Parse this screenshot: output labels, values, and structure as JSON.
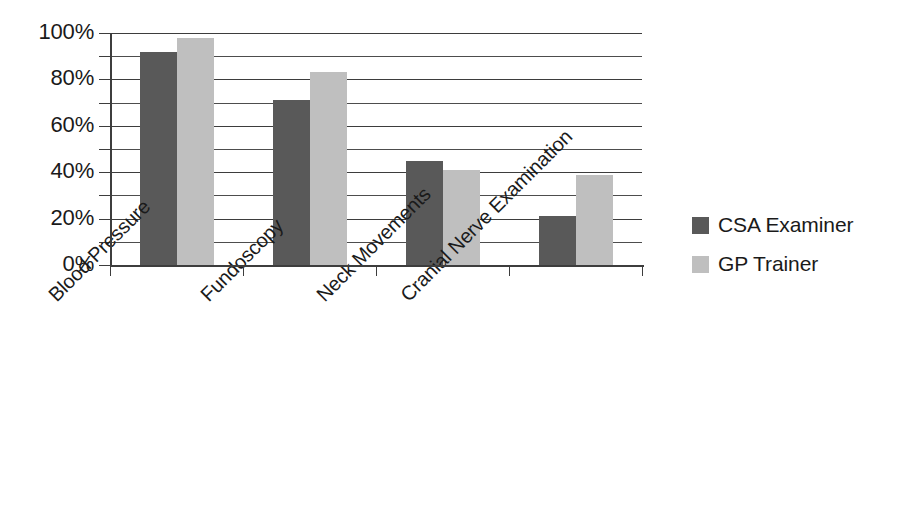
{
  "chart_data": {
    "type": "bar",
    "title": "",
    "subtitle": "",
    "xlabel": "",
    "ylabel": "",
    "categories": [
      "Blood Pressure",
      "Fundoscopy",
      "Neck Movements",
      "Cranial Nerve Examination"
    ],
    "series": [
      {
        "name": "CSA Examiner",
        "values": [
          92,
          71,
          45,
          21
        ],
        "color": "#595959"
      },
      {
        "name": "GP Trainer",
        "values": [
          98,
          83,
          41,
          39
        ],
        "color": "#bfbfbf"
      }
    ],
    "ylim": [
      0,
      100
    ],
    "ytick_labels": [
      "0%",
      "20%",
      "40%",
      "60%",
      "80%",
      "100%"
    ],
    "ytick_values": [
      0,
      20,
      40,
      60,
      80,
      100
    ],
    "minor_tick_interval": 10,
    "gridlines": [
      10,
      20,
      30,
      40,
      50,
      60,
      70,
      80,
      90,
      100
    ],
    "grid": true,
    "legend_position": "right",
    "value_format": "percent"
  },
  "legend": {
    "items": [
      {
        "label": "CSA Examiner",
        "color": "#595959"
      },
      {
        "label": "GP Trainer",
        "color": "#bfbfbf"
      }
    ]
  }
}
